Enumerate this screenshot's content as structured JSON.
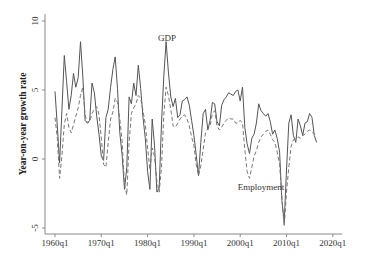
{
  "chart_data": {
    "type": "line",
    "title": "",
    "xlabel": "",
    "ylabel": "Year-on-year growth rate",
    "xlim": [
      1958.5,
      2022
    ],
    "ylim": [
      -5.5,
      10.5
    ],
    "yticks": [
      -5,
      0,
      5,
      10
    ],
    "ytick_labels": [
      "-5",
      "0",
      "5",
      "10"
    ],
    "xticks": [
      1960,
      1970,
      1980,
      1990,
      2000,
      2010,
      2020
    ],
    "xtick_labels": [
      "1960q1",
      "1970q1",
      "1980q1",
      "1990q1",
      "2000q1",
      "2010q1",
      "2020q1"
    ],
    "grid": false,
    "legend": "none (inline annotations)",
    "annotations": [
      {
        "text": "GDP",
        "x": 1984.2,
        "y": 8.8
      },
      {
        "text": "Employment",
        "x": 2004.5,
        "y": -2.0
      }
    ],
    "series": [
      {
        "name": "GDP",
        "style": "solid",
        "color": "#555555",
        "x": [
          1960.0,
          1960.5,
          1961.0,
          1961.5,
          1962.0,
          1962.5,
          1963.0,
          1963.5,
          1964.0,
          1964.5,
          1965.0,
          1965.5,
          1966.0,
          1966.5,
          1967.0,
          1967.5,
          1968.0,
          1968.5,
          1969.0,
          1969.5,
          1970.0,
          1970.5,
          1971.0,
          1971.5,
          1972.0,
          1972.5,
          1973.0,
          1973.5,
          1974.0,
          1974.5,
          1975.0,
          1975.5,
          1976.0,
          1976.5,
          1977.0,
          1977.5,
          1978.0,
          1978.5,
          1979.0,
          1979.5,
          1980.0,
          1980.5,
          1981.0,
          1981.5,
          1982.0,
          1982.5,
          1983.0,
          1983.5,
          1984.0,
          1984.5,
          1985.0,
          1985.5,
          1986.0,
          1986.5,
          1987.0,
          1987.5,
          1988.0,
          1988.5,
          1989.0,
          1989.5,
          1990.0,
          1990.5,
          1991.0,
          1991.5,
          1992.0,
          1992.5,
          1993.0,
          1993.5,
          1994.0,
          1994.5,
          1995.0,
          1995.5,
          1996.0,
          1996.5,
          1997.0,
          1997.5,
          1998.0,
          1998.5,
          1999.0,
          1999.5,
          2000.0,
          2000.5,
          2001.0,
          2001.5,
          2002.0,
          2002.5,
          2003.0,
          2003.5,
          2004.0,
          2004.5,
          2005.0,
          2005.5,
          2006.0,
          2006.5,
          2007.0,
          2007.5,
          2008.0,
          2008.5,
          2009.0,
          2009.5,
          2010.0,
          2010.5,
          2011.0,
          2011.5,
          2012.0,
          2012.5,
          2013.0,
          2013.5,
          2014.0,
          2014.5,
          2015.0,
          2015.5,
          2016.0,
          2016.5
        ],
        "y": [
          4.9,
          2.4,
          -0.3,
          3.5,
          7.5,
          5.6,
          3.6,
          4.6,
          6.2,
          5.2,
          5.9,
          8.5,
          6.0,
          2.8,
          2.6,
          2.8,
          5.5,
          4.8,
          3.1,
          1.8,
          0.2,
          -0.1,
          3.0,
          3.6,
          5.2,
          6.5,
          7.4,
          5.1,
          1.9,
          0.3,
          -2.2,
          -0.6,
          4.5,
          4.0,
          5.5,
          4.6,
          6.8,
          5.1,
          3.0,
          1.5,
          -0.9,
          -2.2,
          2.9,
          1.0,
          -2.4,
          -2.1,
          2.6,
          6.0,
          8.5,
          6.3,
          4.5,
          3.8,
          4.4,
          3.0,
          3.2,
          4.2,
          4.3,
          4.5,
          3.9,
          2.8,
          1.7,
          0.3,
          -1.2,
          1.2,
          3.3,
          3.6,
          2.1,
          2.8,
          4.1,
          4.0,
          2.7,
          2.4,
          3.9,
          4.3,
          4.5,
          4.8,
          4.7,
          4.6,
          4.9,
          5.0,
          4.2,
          5.2,
          2.3,
          1.1,
          0.4,
          1.5,
          1.8,
          2.6,
          4.0,
          3.5,
          3.3,
          3.1,
          3.3,
          2.7,
          1.8,
          2.1,
          1.5,
          0.5,
          -3.0,
          -4.6,
          -0.8,
          2.6,
          3.2,
          1.7,
          1.2,
          2.9,
          2.4,
          1.7,
          2.6,
          2.7,
          3.3,
          3.0,
          1.7,
          1.2
        ]
      },
      {
        "name": "Employment",
        "style": "dashed",
        "color": "#777777",
        "x": [
          1960.0,
          1960.5,
          1961.0,
          1961.5,
          1962.0,
          1962.5,
          1963.0,
          1963.5,
          1964.0,
          1964.5,
          1965.0,
          1965.5,
          1966.0,
          1966.5,
          1967.0,
          1967.5,
          1968.0,
          1968.5,
          1969.0,
          1969.5,
          1970.0,
          1970.5,
          1971.0,
          1971.5,
          1972.0,
          1972.5,
          1973.0,
          1973.5,
          1974.0,
          1974.5,
          1975.0,
          1975.5,
          1976.0,
          1976.5,
          1977.0,
          1977.5,
          1978.0,
          1978.5,
          1979.0,
          1979.5,
          1980.0,
          1980.5,
          1981.0,
          1981.5,
          1982.0,
          1982.5,
          1983.0,
          1983.5,
          1984.0,
          1984.5,
          1985.0,
          1985.5,
          1986.0,
          1986.5,
          1987.0,
          1987.5,
          1988.0,
          1988.5,
          1989.0,
          1989.5,
          1990.0,
          1990.5,
          1991.0,
          1991.5,
          1992.0,
          1992.5,
          1993.0,
          1993.5,
          1994.0,
          1994.5,
          1995.0,
          1995.5,
          1996.0,
          1996.5,
          1997.0,
          1997.5,
          1998.0,
          1998.5,
          1999.0,
          1999.5,
          2000.0,
          2000.5,
          2001.0,
          2001.5,
          2002.0,
          2002.5,
          2003.0,
          2003.5,
          2004.0,
          2004.5,
          2005.0,
          2005.5,
          2006.0,
          2006.5,
          2007.0,
          2007.5,
          2008.0,
          2008.5,
          2009.0,
          2009.5,
          2010.0,
          2010.5,
          2011.0,
          2011.5,
          2012.0,
          2012.5,
          2013.0,
          2013.5,
          2014.0,
          2014.5,
          2015.0,
          2015.5,
          2016.0,
          2016.5
        ],
        "y": [
          3.0,
          1.5,
          -1.4,
          0.2,
          2.5,
          3.3,
          2.3,
          1.9,
          2.5,
          3.1,
          3.7,
          4.6,
          5.2,
          3.2,
          2.6,
          2.7,
          3.3,
          3.6,
          3.8,
          3.2,
          1.5,
          -0.4,
          -0.6,
          1.2,
          2.9,
          3.4,
          4.4,
          4.1,
          2.9,
          1.3,
          -1.9,
          -2.6,
          1.2,
          3.3,
          3.7,
          4.0,
          4.6,
          4.4,
          3.5,
          2.5,
          0.8,
          -0.8,
          0.8,
          0.2,
          -1.6,
          -2.4,
          -0.6,
          3.2,
          5.2,
          4.6,
          3.6,
          2.4,
          2.3,
          2.6,
          2.9,
          3.1,
          3.2,
          2.9,
          2.4,
          1.6,
          1.0,
          -0.4,
          -1.2,
          -0.5,
          0.7,
          1.9,
          2.2,
          2.4,
          3.3,
          3.5,
          2.4,
          2.1,
          2.3,
          2.6,
          2.8,
          3.0,
          2.9,
          2.9,
          2.6,
          2.6,
          2.8,
          2.6,
          0.7,
          -0.9,
          -1.4,
          -0.6,
          0.2,
          0.6,
          1.2,
          1.6,
          1.8,
          2.0,
          2.1,
          1.8,
          1.4,
          1.2,
          0.5,
          -0.4,
          -2.8,
          -4.9,
          -2.4,
          -0.6,
          0.9,
          1.4,
          1.5,
          1.6,
          1.5,
          1.7,
          1.8,
          2.0,
          2.1,
          2.0,
          1.8,
          1.6
        ]
      }
    ]
  }
}
